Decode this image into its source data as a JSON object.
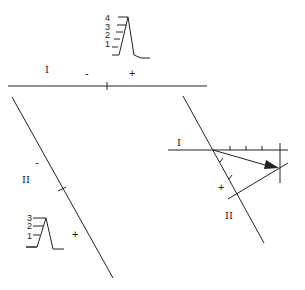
{
  "figure": {
    "lead_I": {
      "label": "I",
      "negative_sign": "-",
      "positive_sign": "+"
    },
    "lead_II": {
      "label": "II",
      "negative_sign": "-",
      "positive_sign": "+"
    },
    "waveform_I": {
      "ticks": [
        "4",
        "3",
        "2",
        "1"
      ]
    },
    "waveform_II": {
      "ticks": [
        "3",
        "2",
        "1"
      ]
    },
    "vector_construction": {
      "lead_I_label": "I",
      "lead_II_label": "II",
      "positive_sign": "+"
    },
    "colors": {
      "ink": "#222222",
      "background": "#ffffff"
    }
  }
}
